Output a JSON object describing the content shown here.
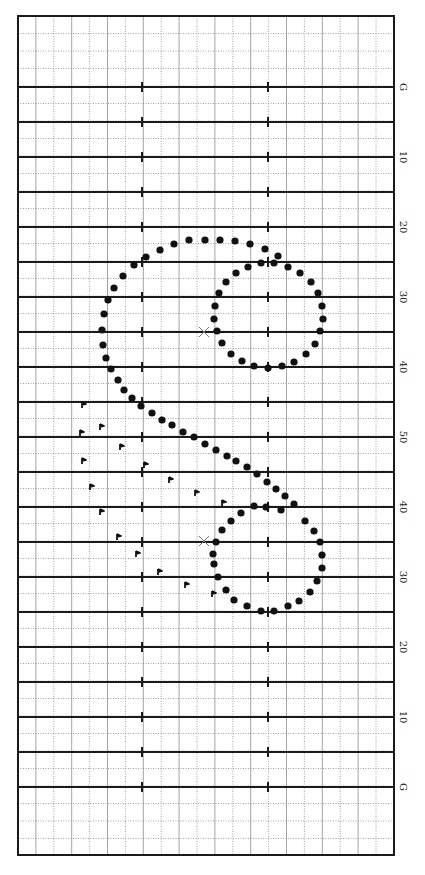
{
  "chart_data": {
    "type": "scatter",
    "title": "",
    "field": {
      "left": 18,
      "right": 394,
      "top": 16,
      "bottom": 855,
      "goal_top_y": 87,
      "goal_bottom_y": 787,
      "yard_spacing_px": 35,
      "hash_x": [
        142,
        268
      ],
      "grid_columns_x": [
        18,
        35.9,
        53.8,
        71.7,
        89.6,
        107.5,
        125.4,
        143.3,
        161.2,
        179.1,
        197,
        214.9,
        232.8,
        250.7,
        268.6,
        286.5,
        304.4,
        322.3,
        340.2,
        358.1,
        376,
        394
      ]
    },
    "yard_lines": [
      {
        "y": 87,
        "label": "G"
      },
      {
        "y": 122,
        "label": ""
      },
      {
        "y": 157,
        "label": "10"
      },
      {
        "y": 192,
        "label": ""
      },
      {
        "y": 227,
        "label": "20"
      },
      {
        "y": 262,
        "label": ""
      },
      {
        "y": 297,
        "label": "30"
      },
      {
        "y": 332,
        "label": ""
      },
      {
        "y": 367,
        "label": "40"
      },
      {
        "y": 402,
        "label": ""
      },
      {
        "y": 437,
        "label": "50"
      },
      {
        "y": 472,
        "label": ""
      },
      {
        "y": 507,
        "label": "40"
      },
      {
        "y": 542,
        "label": ""
      },
      {
        "y": 577,
        "label": "30"
      },
      {
        "y": 612,
        "label": ""
      },
      {
        "y": 647,
        "label": "20"
      },
      {
        "y": 682,
        "label": ""
      },
      {
        "y": 717,
        "label": "10"
      },
      {
        "y": 752,
        "label": ""
      },
      {
        "y": 787,
        "label": "G"
      }
    ],
    "series": [
      {
        "name": "marchers",
        "marker": "dot",
        "points": [
          [
            146,
            257
          ],
          [
            160,
            250
          ],
          [
            174,
            244
          ],
          [
            189,
            240
          ],
          [
            205,
            240
          ],
          [
            220,
            240
          ],
          [
            235,
            241
          ],
          [
            250,
            244
          ],
          [
            265,
            249
          ],
          [
            278,
            256
          ],
          [
            134,
            265
          ],
          [
            123,
            276
          ],
          [
            114,
            288
          ],
          [
            108,
            300
          ],
          [
            104,
            314
          ],
          [
            102,
            330
          ],
          [
            103,
            345
          ],
          [
            106,
            358
          ],
          [
            111,
            369
          ],
          [
            118,
            380
          ],
          [
            124,
            390
          ],
          [
            132,
            398
          ],
          [
            141,
            406
          ],
          [
            152,
            413
          ],
          [
            162,
            420
          ],
          [
            172,
            425
          ],
          [
            183,
            432
          ],
          [
            194,
            437
          ],
          [
            205,
            444
          ],
          [
            216,
            450
          ],
          [
            227,
            456
          ],
          [
            236,
            461
          ],
          [
            247,
            467
          ],
          [
            257,
            474
          ],
          [
            267,
            482
          ],
          [
            276,
            489
          ],
          [
            285,
            496
          ],
          [
            294,
            504
          ],
          [
            236,
            273
          ],
          [
            248,
            267
          ],
          [
            261,
            263
          ],
          [
            274,
            263
          ],
          [
            288,
            267
          ],
          [
            300,
            273
          ],
          [
            311,
            282
          ],
          [
            318,
            293
          ],
          [
            322,
            306
          ],
          [
            323,
            319
          ],
          [
            320,
            331
          ],
          [
            315,
            344
          ],
          [
            306,
            354
          ],
          [
            294,
            362
          ],
          [
            282,
            366
          ],
          [
            268,
            368
          ],
          [
            254,
            366
          ],
          [
            242,
            361
          ],
          [
            231,
            354
          ],
          [
            222,
            343
          ],
          [
            217,
            331
          ],
          [
            214,
            319
          ],
          [
            215,
            306
          ],
          [
            219,
            293
          ],
          [
            226,
            282
          ],
          [
            254,
            506
          ],
          [
            266,
            507
          ],
          [
            281,
            510
          ],
          [
            305,
            521
          ],
          [
            314,
            531
          ],
          [
            320,
            542
          ],
          [
            322,
            555
          ],
          [
            322,
            568
          ],
          [
            317,
            581
          ],
          [
            310,
            592
          ],
          [
            299,
            601
          ],
          [
            288,
            606
          ],
          [
            274,
            611
          ],
          [
            261,
            611
          ],
          [
            247,
            606
          ],
          [
            234,
            600
          ],
          [
            226,
            590
          ],
          [
            218,
            577
          ],
          [
            214,
            564
          ],
          [
            213,
            554
          ],
          [
            216,
            542
          ],
          [
            222,
            530
          ],
          [
            231,
            521
          ],
          [
            241,
            513
          ]
        ]
      },
      {
        "name": "flags",
        "marker": "flag",
        "points": [
          [
            83,
            405
          ],
          [
            101,
            427
          ],
          [
            81,
            433
          ],
          [
            121,
            447
          ],
          [
            83,
            461
          ],
          [
            145,
            465
          ],
          [
            170,
            480
          ],
          [
            91,
            487
          ],
          [
            196,
            493
          ],
          [
            223,
            503
          ],
          [
            101,
            512
          ],
          [
            118,
            537
          ],
          [
            137,
            554
          ],
          [
            159,
            572
          ],
          [
            186,
            585
          ],
          [
            213,
            594
          ]
        ]
      },
      {
        "name": "centers",
        "marker": "x",
        "points": [
          [
            204,
            332
          ],
          [
            204,
            541
          ]
        ]
      }
    ],
    "colors": {
      "border": "#1a1a1a",
      "yard_line": "#1a1a1a",
      "grid_solid": "#9a9a9a",
      "grid_dotted": "#8a8a8a",
      "dot": "#111111",
      "x_marker": "#777777"
    }
  }
}
